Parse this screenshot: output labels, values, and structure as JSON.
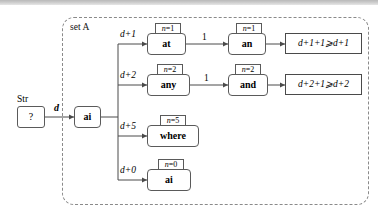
{
  "figure": {
    "type": "flow-diagram",
    "set_label": "set A",
    "input": {
      "caption": "Str",
      "value": "?",
      "edge_label": "d"
    },
    "pivot_node": {
      "label": "ai"
    },
    "branches": [
      {
        "edge_label": "d+1",
        "node": {
          "label": "at",
          "tag_var": "n",
          "tag_eq": "=",
          "tag_value": "1"
        },
        "next_edge_label": "1",
        "next_node": {
          "label": "an",
          "tag_var": "n",
          "tag_eq": "=",
          "tag_value": "1"
        },
        "result": "d+1+1⩾d+1"
      },
      {
        "edge_label": "d+2",
        "node": {
          "label": "any",
          "tag_var": "n",
          "tag_eq": "=",
          "tag_value": "2"
        },
        "next_edge_label": "1",
        "next_node": {
          "label": "and",
          "tag_var": "n",
          "tag_eq": "=",
          "tag_value": "2"
        },
        "result": "d+2+1⩾d+2"
      },
      {
        "edge_label": "d+5",
        "node": {
          "label": "where",
          "tag_var": "n",
          "tag_eq": "=",
          "tag_value": "5"
        },
        "next_edge_label": null,
        "next_node": null,
        "result": null
      },
      {
        "edge_label": "d+0",
        "node": {
          "label": "ai",
          "tag_var": "n",
          "tag_eq": "=",
          "tag_value": "0"
        },
        "next_edge_label": null,
        "next_node": null,
        "result": null
      }
    ],
    "colors": {
      "stroke": "#4a4a4a",
      "node_stroke": "#5a5a5a",
      "set_border": "#8a8a8a",
      "background": "#ffffff",
      "topbar": "#c9c9c9"
    }
  }
}
